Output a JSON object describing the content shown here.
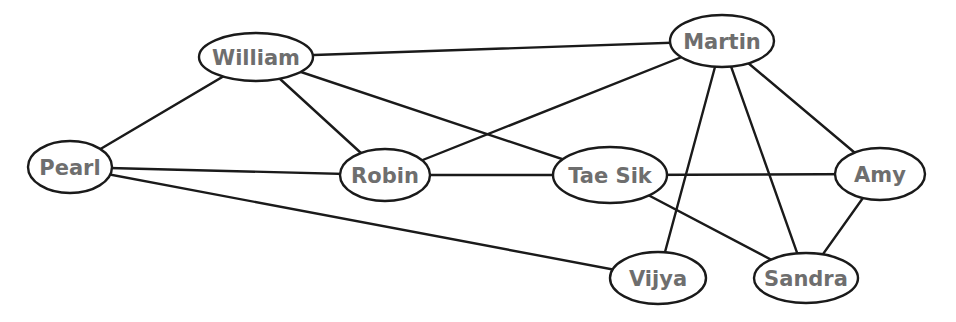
{
  "diagram": {
    "type": "undirected-graph",
    "colors": {
      "background": "#ffffff",
      "stroke": "#1a1a1a",
      "label": "#6e6e6e"
    },
    "nodes": [
      {
        "id": "william",
        "label": "William",
        "cx": 256,
        "cy": 57,
        "rx": 57,
        "ry": 24
      },
      {
        "id": "martin",
        "label": "Martin",
        "cx": 722,
        "cy": 41,
        "rx": 52,
        "ry": 26
      },
      {
        "id": "pearl",
        "label": "Pearl",
        "cx": 70,
        "cy": 167,
        "rx": 42,
        "ry": 26
      },
      {
        "id": "robin",
        "label": "Robin",
        "cx": 385,
        "cy": 175,
        "rx": 45,
        "ry": 26
      },
      {
        "id": "taesik",
        "label": "Tae Sik",
        "cx": 610,
        "cy": 175,
        "rx": 57,
        "ry": 28
      },
      {
        "id": "amy",
        "label": "Amy",
        "cx": 880,
        "cy": 174,
        "rx": 45,
        "ry": 26
      },
      {
        "id": "vijya",
        "label": "Vijya",
        "cx": 658,
        "cy": 278,
        "rx": 48,
        "ry": 26
      },
      {
        "id": "sandra",
        "label": "Sandra",
        "cx": 806,
        "cy": 278,
        "rx": 52,
        "ry": 25
      }
    ],
    "edges": [
      {
        "from": "william",
        "to": "martin"
      },
      {
        "from": "william",
        "to": "pearl"
      },
      {
        "from": "william",
        "to": "robin"
      },
      {
        "from": "william",
        "to": "taesik"
      },
      {
        "from": "martin",
        "to": "robin"
      },
      {
        "from": "martin",
        "to": "vijya"
      },
      {
        "from": "martin",
        "to": "sandra"
      },
      {
        "from": "martin",
        "to": "amy"
      },
      {
        "from": "pearl",
        "to": "robin"
      },
      {
        "from": "pearl",
        "to": "vijya"
      },
      {
        "from": "robin",
        "to": "taesik"
      },
      {
        "from": "taesik",
        "to": "amy"
      },
      {
        "from": "taesik",
        "to": "sandra"
      },
      {
        "from": "amy",
        "to": "sandra"
      }
    ]
  }
}
